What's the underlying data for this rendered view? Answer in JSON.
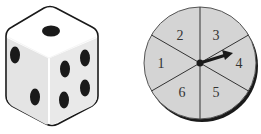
{
  "die": {
    "label": "six-sided die",
    "faces_visible": {
      "top": 1,
      "left": 2,
      "right": 4
    }
  },
  "spinner": {
    "label": "spinner",
    "sections": [
      "1",
      "2",
      "3",
      "4",
      "5",
      "6"
    ],
    "arrow_points_to": "4"
  },
  "colors": {
    "outline": "#1a1a1a",
    "spinner_fill": "#d4d4d4",
    "die_face": "#ffffff",
    "die_shade": "#e2e2e2",
    "pip": "#1a1a1a"
  }
}
